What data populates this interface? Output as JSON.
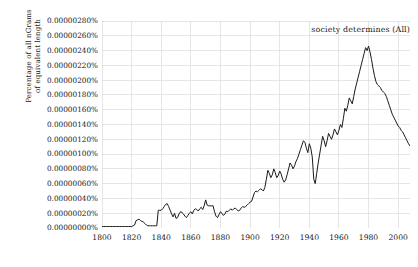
{
  "chart_data": {
    "type": "line",
    "title": "",
    "subtitle": "",
    "xlabel": "",
    "ylabel_lines": [
      "Percentage of all nGrams",
      "of equivalent length"
    ],
    "ylabel": "Percentage of all nGrams of equivalent length",
    "legend": [
      {
        "name": "society determines (All)",
        "color": "#1a1a1a"
      }
    ],
    "legend_position": "top-right",
    "grid": true,
    "grid_color": "#dcdcdc",
    "line_color": "#1a1a1a",
    "axis_color": "#bdbdbd",
    "xlim": [
      1800,
      2008
    ],
    "ylim": [
      0.0,
      2.8e-06
    ],
    "xticks": [
      1800,
      1820,
      1840,
      1860,
      1880,
      1900,
      1920,
      1940,
      1960,
      1980,
      2000
    ],
    "xtick_labels": [
      "1800",
      "1820",
      "1840",
      "1860",
      "1880",
      "1900",
      "1920",
      "1940",
      "1960",
      "1980",
      "2000"
    ],
    "yticks": [
      0.0,
      2e-07,
      4e-07,
      6e-07,
      8e-07,
      1e-06,
      1.2e-06,
      1.4e-06,
      1.6e-06,
      1.8e-06,
      2e-06,
      2.2e-06,
      2.4e-06,
      2.6e-06,
      2.8e-06
    ],
    "ytick_labels": [
      "0.00000000%",
      "0.00000020%",
      "0.00000040%",
      "0.00000060%",
      "0.00000080%",
      "0.00000100%",
      "0.00000120%",
      "0.00000140%",
      "0.00000160%",
      "0.00000180%",
      "0.00000200%",
      "0.00000220%",
      "0.00000240%",
      "0.00000260%",
      "0.00000280%"
    ],
    "y_unit": "percent",
    "series": [
      {
        "name": "society determines (All)",
        "x": [
          1800,
          1801,
          1802,
          1803,
          1804,
          1805,
          1806,
          1807,
          1808,
          1809,
          1810,
          1811,
          1812,
          1813,
          1814,
          1815,
          1816,
          1817,
          1818,
          1819,
          1820,
          1821,
          1822,
          1823,
          1824,
          1825,
          1826,
          1827,
          1828,
          1829,
          1830,
          1831,
          1832,
          1833,
          1834,
          1835,
          1836,
          1837,
          1838,
          1839,
          1840,
          1841,
          1842,
          1843,
          1844,
          1845,
          1846,
          1847,
          1848,
          1849,
          1850,
          1851,
          1852,
          1853,
          1854,
          1855,
          1856,
          1857,
          1858,
          1859,
          1860,
          1861,
          1862,
          1863,
          1864,
          1865,
          1866,
          1867,
          1868,
          1869,
          1870,
          1871,
          1872,
          1873,
          1874,
          1875,
          1876,
          1877,
          1878,
          1879,
          1880,
          1881,
          1882,
          1883,
          1884,
          1885,
          1886,
          1887,
          1888,
          1889,
          1890,
          1891,
          1892,
          1893,
          1894,
          1895,
          1896,
          1897,
          1898,
          1899,
          1900,
          1901,
          1902,
          1903,
          1904,
          1905,
          1906,
          1907,
          1908,
          1909,
          1910,
          1911,
          1912,
          1913,
          1914,
          1915,
          1916,
          1917,
          1918,
          1919,
          1920,
          1921,
          1922,
          1923,
          1924,
          1925,
          1926,
          1927,
          1928,
          1929,
          1930,
          1931,
          1932,
          1933,
          1934,
          1935,
          1936,
          1937,
          1938,
          1939,
          1940,
          1941,
          1942,
          1943,
          1944,
          1945,
          1946,
          1947,
          1948,
          1949,
          1950,
          1951,
          1952,
          1953,
          1954,
          1955,
          1956,
          1957,
          1958,
          1959,
          1960,
          1961,
          1962,
          1963,
          1964,
          1965,
          1966,
          1967,
          1968,
          1969,
          1970,
          1971,
          1972,
          1973,
          1974,
          1975,
          1976,
          1977,
          1978,
          1979,
          1980,
          1981,
          1982,
          1983,
          1984,
          1985,
          1986,
          1987,
          1988,
          1989,
          1990,
          1991,
          1992,
          1993,
          1994,
          1995,
          1996,
          1997,
          1998,
          1999,
          2000,
          2001,
          2002,
          2003,
          2004,
          2005,
          2006,
          2007,
          2008
        ],
        "values": [
          2e-08,
          2e-08,
          2e-08,
          2e-08,
          2e-08,
          2e-08,
          2e-08,
          2e-08,
          2e-08,
          2e-08,
          2e-08,
          2e-08,
          2e-08,
          2e-08,
          2e-08,
          2e-08,
          2e-08,
          2e-08,
          2e-08,
          2e-08,
          2e-08,
          3e-08,
          4e-08,
          1e-07,
          1.1e-07,
          1.2e-07,
          1e-07,
          9e-08,
          8e-08,
          6e-08,
          4e-08,
          3e-08,
          3e-08,
          3e-08,
          3e-08,
          3e-08,
          3e-08,
          3e-08,
          2.4e-07,
          2.4e-07,
          2.4e-07,
          2.6e-07,
          2.9e-07,
          3.2e-07,
          3.3e-07,
          2.9e-07,
          2.4e-07,
          1.9e-07,
          1.5e-07,
          2e-07,
          1.3e-07,
          1.4e-07,
          1.9e-07,
          2.2e-07,
          2.1e-07,
          1.9e-07,
          1.6e-07,
          1.4e-07,
          1.7e-07,
          2e-07,
          2.2e-07,
          1.9e-07,
          2.4e-07,
          2.6e-07,
          2.5e-07,
          2.3e-07,
          2.6e-07,
          2.8e-07,
          2.5e-07,
          3e-07,
          3.8e-07,
          3.1e-07,
          3e-07,
          3e-07,
          3e-07,
          3e-07,
          2.2e-07,
          1.6e-07,
          1.4e-07,
          1.8e-07,
          2.2e-07,
          2e-07,
          1.7e-07,
          1.9e-07,
          2.3e-07,
          2.2e-07,
          2.4e-07,
          2.6e-07,
          2.4e-07,
          2.6e-07,
          2.7e-07,
          2.5e-07,
          2.3e-07,
          2.4e-07,
          2.7e-07,
          2.9e-07,
          2.8e-07,
          2.9e-07,
          3.1e-07,
          3.3e-07,
          3.5e-07,
          3.6e-07,
          4.2e-07,
          4.8e-07,
          5e-07,
          4.9e-07,
          5.1e-07,
          5.3e-07,
          5.2e-07,
          5e-07,
          5.5e-07,
          6.6e-07,
          7.8e-07,
          7.4e-07,
          6.8e-07,
          7.2e-07,
          8e-07,
          7.5e-07,
          6.8e-07,
          7.1e-07,
          7.7e-07,
          7.3e-07,
          6.6e-07,
          6.2e-07,
          6.5e-07,
          7.2e-07,
          8e-07,
          8.8e-07,
          8.5e-07,
          8e-07,
          8.4e-07,
          9e-07,
          9.4e-07,
          1e-06,
          1.06e-06,
          1.12e-06,
          1.18e-06,
          1.16e-06,
          1.08e-06,
          1.02e-06,
          1.14e-06,
          1.08e-06,
          9.6e-07,
          6.6e-07,
          6e-07,
          7.4e-07,
          8.8e-07,
          1e-06,
          1.12e-06,
          1.24e-06,
          1.18e-06,
          1.1e-06,
          1.18e-06,
          1.28e-06,
          1.24e-06,
          1.2e-06,
          1.26e-06,
          1.34e-06,
          1.3e-06,
          1.26e-06,
          1.32e-06,
          1.4e-06,
          1.36e-06,
          1.48e-06,
          1.62e-06,
          1.58e-06,
          1.66e-06,
          1.76e-06,
          1.72e-06,
          1.68e-06,
          1.78e-06,
          1.88e-06,
          1.96e-06,
          2.04e-06,
          2.12e-06,
          2.2e-06,
          2.28e-06,
          2.36e-06,
          2.44e-06,
          2.4e-06,
          2.46e-06,
          2.38e-06,
          2.28e-06,
          2.16e-06,
          2.06e-06,
          1.98e-06,
          1.94e-06,
          1.92e-06,
          1.9e-06,
          1.86e-06,
          1.84e-06,
          1.82e-06,
          1.78e-06,
          1.72e-06,
          1.66e-06,
          1.6e-06,
          1.54e-06,
          1.5e-06,
          1.46e-06,
          1.42e-06,
          1.38e-06,
          1.36e-06,
          1.32e-06,
          1.3e-06,
          1.26e-06,
          1.22e-06,
          1.18e-06,
          1.14e-06,
          1.11e-06
        ],
        "peak": {
          "year": 1976,
          "value": 2.46e-06
        },
        "end": {
          "year": 2008,
          "value": 1.11e-06
        }
      }
    ]
  }
}
